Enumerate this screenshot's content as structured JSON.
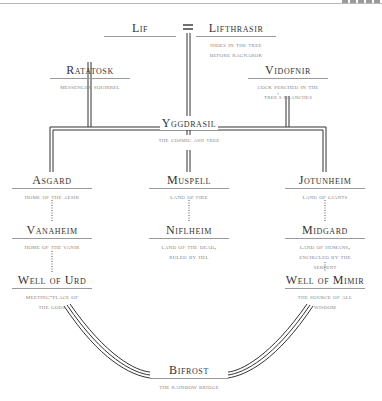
{
  "diagram": {
    "title_fragment": "",
    "nodes": {
      "lif": {
        "title": "Lif",
        "desc": ""
      },
      "lifthrasir": {
        "title": "Lifthrasir",
        "desc": "Hides in the tree before Ragnarok"
      },
      "ratatosk": {
        "title": "Ratatosk",
        "desc": "Messenger squirrel"
      },
      "vidofnir": {
        "title": "Vidofnir",
        "desc": "Cock perched in the tree's branches"
      },
      "yggdrasil": {
        "title": "Yggdrasil",
        "desc": "The cosmic ash tree"
      },
      "asgard": {
        "title": "Asgard",
        "desc": "Home of the Aesir"
      },
      "muspell": {
        "title": "Muspell",
        "desc": "Land of fire"
      },
      "jotunheim": {
        "title": "Jotunheim",
        "desc": "Land of giants"
      },
      "vanaheim": {
        "title": "Vanaheim",
        "desc": "Home of the Vanir"
      },
      "niflheim": {
        "title": "Niflheim",
        "desc": "Land of the dead, ruled by Hel"
      },
      "midgard": {
        "title": "Midgard",
        "desc": "Land of humans, encircled by the serpent"
      },
      "well_of_urd": {
        "title": "Well of Urd",
        "desc": "Meeting-place of the gods"
      },
      "well_of_mimir": {
        "title": "Well of Mimir",
        "desc": "The source of all wisdom"
      },
      "bifrost": {
        "title": "Bifrost",
        "desc": "The rainbow bridge"
      }
    },
    "marriage_symbol": "=",
    "colors": {
      "line": "#333333",
      "rule": "#9a9a9a",
      "title": "#333333",
      "desc": "#888888"
    }
  }
}
